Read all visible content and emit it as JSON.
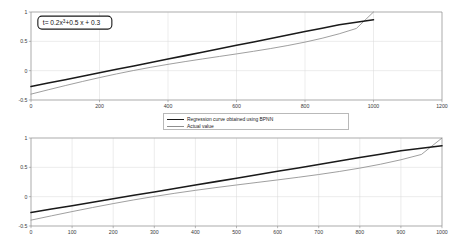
{
  "figure": {
    "background_color": "#ffffff",
    "series_colors": {
      "bpnn": "#1a1a1a",
      "actual": "#8e8e8e"
    }
  },
  "legend": {
    "position": "between-panels",
    "entries": [
      {
        "key": "bpnn",
        "label": "Regression curve obtained using BPNN",
        "style": "thick-black-line"
      },
      {
        "key": "actual",
        "label": "Actual value",
        "style": "thin-gray-line"
      }
    ]
  },
  "annotation": {
    "prefix": "t= 0.2x",
    "exponent": "3",
    "suffix": "+0.5 x + 0.3",
    "full_text": "t= 0.2x3 +0.5 x + 0.3"
  },
  "axis_labels": {
    "top_x": [
      "0",
      "200",
      "400",
      "600",
      "800",
      "1000",
      "1200"
    ],
    "top_y": [
      "-0.5",
      "0",
      "0.5",
      "1"
    ],
    "bottom_x": [
      "0",
      "100",
      "200",
      "300",
      "400",
      "500",
      "600",
      "700",
      "800",
      "900",
      "1000"
    ],
    "bottom_y": [
      "-0.5",
      "0",
      "0.5",
      "1"
    ]
  },
  "chart_data": [
    {
      "id": "top-panel",
      "type": "line",
      "title": "",
      "xlabel": "",
      "ylabel": "",
      "xlim": [
        0,
        1200
      ],
      "ylim": [
        -0.5,
        1
      ],
      "xticks": [
        0,
        200,
        400,
        600,
        800,
        1000,
        1200
      ],
      "yticks": [
        -0.5,
        0,
        0.5,
        1
      ],
      "grid": true,
      "annotation": "t= 0.2x^3 +0.5 x + 0.3",
      "x": [
        0,
        50,
        100,
        150,
        200,
        250,
        300,
        350,
        400,
        450,
        500,
        550,
        600,
        650,
        700,
        750,
        800,
        850,
        900,
        950,
        1000
      ],
      "series": [
        {
          "name": "Regression curve obtained using BPNN",
          "color": "#1a1a1a",
          "values": [
            -0.27,
            -0.2115,
            -0.153,
            -0.0945,
            -0.036,
            0.0225,
            0.081,
            0.1395,
            0.198,
            0.2565,
            0.315,
            0.3735,
            0.432,
            0.4905,
            0.549,
            0.6075,
            0.666,
            0.7245,
            0.783,
            0.8255,
            0.868
          ]
        },
        {
          "name": "Actual value",
          "color": "#8e8e8e",
          "values": [
            -0.4,
            -0.3263,
            -0.2543,
            -0.1847,
            -0.1181,
            -0.0551,
            0.0035,
            0.0577,
            0.1079,
            0.1547,
            0.1992,
            0.2424,
            0.2856,
            0.3302,
            0.3775,
            0.4291,
            0.4867,
            0.5524,
            0.6289,
            0.7196,
            1.0
          ]
        }
      ]
    },
    {
      "id": "bottom-panel",
      "type": "line",
      "title": "",
      "xlabel": "",
      "ylabel": "",
      "xlim": [
        0,
        1000
      ],
      "ylim": [
        -0.5,
        1
      ],
      "xticks": [
        0,
        100,
        200,
        300,
        400,
        500,
        600,
        700,
        800,
        900,
        1000
      ],
      "yticks": [
        -0.5,
        0,
        0.5,
        1
      ],
      "grid": true,
      "x": [
        0,
        50,
        100,
        150,
        200,
        250,
        300,
        350,
        400,
        450,
        500,
        550,
        600,
        650,
        700,
        750,
        800,
        850,
        900,
        950,
        1000
      ],
      "series": [
        {
          "name": "Regression curve obtained using BPNN",
          "color": "#1a1a1a",
          "values": [
            -0.27,
            -0.2115,
            -0.153,
            -0.0945,
            -0.036,
            0.0225,
            0.081,
            0.1395,
            0.198,
            0.2565,
            0.315,
            0.3735,
            0.432,
            0.4905,
            0.549,
            0.6075,
            0.666,
            0.7245,
            0.783,
            0.8255,
            0.868
          ]
        },
        {
          "name": "Actual value",
          "color": "#8e8e8e",
          "values": [
            -0.4,
            -0.3263,
            -0.2543,
            -0.1847,
            -0.1181,
            -0.0551,
            0.0035,
            0.0577,
            0.1079,
            0.1547,
            0.1992,
            0.2424,
            0.2856,
            0.3302,
            0.3775,
            0.4291,
            0.4867,
            0.5524,
            0.6289,
            0.7196,
            1.0
          ]
        }
      ]
    }
  ]
}
